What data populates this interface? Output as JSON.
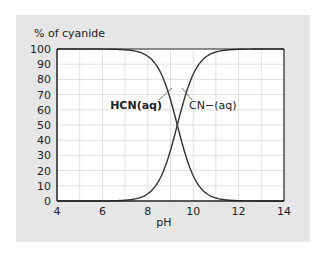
{
  "chart_data": {
    "type": "line",
    "title": "",
    "ylabel": "% of cyanide",
    "xlabel": "pH",
    "xlim": [
      4,
      14
    ],
    "ylim": [
      0,
      100
    ],
    "x_ticks": [
      4,
      6,
      8,
      10,
      12,
      14
    ],
    "y_ticks": [
      0,
      10,
      20,
      30,
      40,
      50,
      60,
      70,
      80,
      90,
      100
    ],
    "grid": true,
    "grid_x_step": 1,
    "grid_y_step": 10,
    "pKa": 9.3,
    "x": [
      4,
      5,
      6,
      7,
      7.5,
      8,
      8.5,
      9,
      9.3,
      9.5,
      10,
      10.5,
      11,
      11.5,
      12,
      13,
      14
    ],
    "series": [
      {
        "name": "HCN(aq)",
        "label_bold": true,
        "values": [
          100,
          100,
          99.9,
          99.5,
          98.4,
          95.2,
          86.3,
          66.6,
          50,
          38.7,
          16.6,
          5.9,
          2.0,
          0.6,
          0.2,
          0,
          0
        ]
      },
      {
        "name": "CN−(aq)",
        "label_bold": false,
        "values": [
          0,
          0,
          0.1,
          0.5,
          1.6,
          4.8,
          13.7,
          33.4,
          50,
          61.3,
          83.4,
          94.1,
          98.0,
          99.4,
          99.8,
          100,
          100
        ]
      }
    ],
    "colors": {
      "panel": "#e6e6e6",
      "plot_bg": "#ffffff",
      "grid": "#d9d9d9",
      "curve": "#333333",
      "axis": "#222222"
    }
  }
}
